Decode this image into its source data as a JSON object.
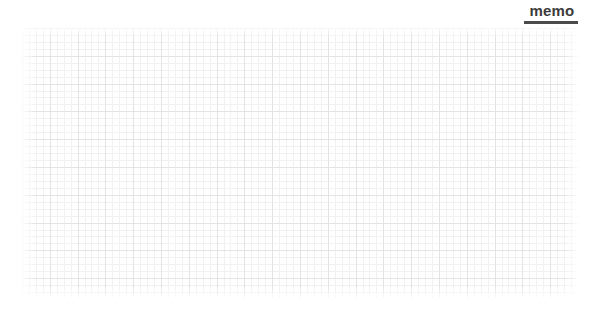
{
  "page": {
    "background_color": "#ffffff",
    "width": 598,
    "height": 310
  },
  "header": {
    "title": "memo",
    "title_color": "#3b3b3b",
    "rule_color": "#4a4a4a"
  },
  "grid": {
    "minor_line_color": "#f1f1f1",
    "major_line_color": "#e3e3e3",
    "minor_spacing_px": 7,
    "major_spacing_px": 28
  },
  "note": {
    "content": "",
    "placeholder": ""
  }
}
